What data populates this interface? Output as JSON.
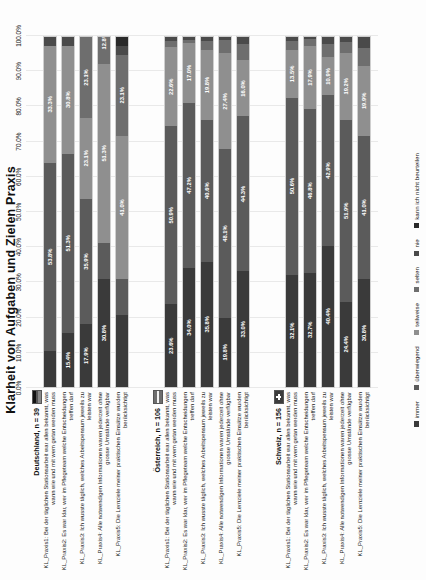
{
  "chart_data": {
    "type": "bar",
    "orientation": "horizontal",
    "stacked": true,
    "stack_mode": "percent",
    "title": "Klarheit von Aufgaben und Zielen Praxis",
    "xlabel": "",
    "ylabel": "",
    "xlim": [
      0,
      100
    ],
    "grid": true,
    "legend_position": "bottom",
    "tick_labels": [
      "0.0%",
      "10.0%",
      "20.0%",
      "30.0%",
      "40.0%",
      "50.0%",
      "60.0%",
      "70.0%",
      "80.0%",
      "90.0%",
      "100.0%"
    ],
    "tick_values": [
      0,
      10,
      20,
      30,
      40,
      50,
      60,
      70,
      80,
      90,
      100
    ],
    "legend": [
      {
        "name": "immer",
        "color": "#3a3a3a"
      },
      {
        "name": "überwiegend",
        "color": "#5b5b5b"
      },
      {
        "name": "teilweise",
        "color": "#8f8f8f"
      },
      {
        "name": "selten",
        "color": "#6e6e6e"
      },
      {
        "name": "nie",
        "color": "#4a4a4a"
      },
      {
        "name": "kann ich nicht beurteilen",
        "color": "#2a2a2a"
      }
    ],
    "groups": [
      {
        "key": "deutschland",
        "label": "Deutschland, n = 39",
        "flag": "flag-de",
        "flag_name": "germany-flag-icon",
        "categories": [
          "KL_Praxis1: Bei der täglichen Stationsarbeit war allen bekannt, was wann wie und mit wem getan werden muss",
          "KL_Praxis2: Es war klar, wer im Pflegeteam welche Entscheidungen treffen darf",
          "KL_Praxis3: Ich wusste täglich, welches Arbeitspensum jeweils zu leisten war",
          "KL_Praxis4: Alle notwendigen Informationen waren jederzeit ohne grosse Umstände verfügbar",
          "KL_Praxis5: Die Lernziele meiner praktischen Einsätze wurden berücksichtigt"
        ],
        "series": [
          {
            "name": "immer",
            "values": [
              10.3,
              15.4,
              17.9,
              30.8,
              20.5
            ]
          },
          {
            "name": "überwiegend",
            "values": [
              53.8,
              51.3,
              35.9,
              10.3,
              10.3
            ]
          },
          {
            "name": "teilweise",
            "values": [
              33.3,
              30.8,
              23.1,
              51.3,
              41.0
            ]
          },
          {
            "name": "selten",
            "values": [
              0.0,
              0.0,
              23.1,
              12.8,
              23.1
            ]
          },
          {
            "name": "nie",
            "values": [
              2.6,
              2.5,
              0.0,
              2.6,
              2.6
            ]
          },
          {
            "name": "kann ich nicht beurteilen",
            "values": [
              0.0,
              0.0,
              0.0,
              2.2,
              2.5
            ]
          }
        ],
        "labeled_values": [
          [
            "15.4%",
            "53.8%",
            "33.3%"
          ],
          [
            "15.4%",
            "51.3%",
            "30.8%"
          ],
          [
            "17.9%",
            "35.9%",
            "23.1%",
            "23.1%"
          ],
          [
            "30.8%",
            "51.3%",
            "12.8%"
          ],
          [
            "30.8%",
            "41.0%",
            "23.1%"
          ]
        ]
      },
      {
        "key": "oesterreich",
        "label": "Österreich, n = 106",
        "flag": "flag-at",
        "flag_name": "austria-flag-icon",
        "categories": [
          "KL_Praxis1: Bei der täglichen Stationsarbeit war allen bekannt, was wann wie und mit wem getan werden muss",
          "KL_Praxis2: Es war klar, wer im Pflegeteam welche Entscheidungen treffen darf",
          "KL_Praxis3: Ich wusste täglich, welches Arbeitspensum jeweils zu leisten war",
          "KL_Praxis4: Alle notwendigen Informationen waren jederzeit ohne grosse Umstände verfügbar",
          "KL_Praxis5: Die Lernziele meiner praktischen Einsätze wurden berücksichtigt"
        ],
        "series": [
          {
            "name": "immer",
            "values": [
              23.6,
              34.0,
              35.8,
              19.8,
              33.0
            ]
          },
          {
            "name": "überwiegend",
            "values": [
              50.9,
              47.2,
              40.6,
              48.1,
              44.3
            ]
          },
          {
            "name": "teilweise",
            "values": [
              22.6,
              17.0,
              19.8,
              27.4,
              16.0
            ]
          },
          {
            "name": "selten",
            "values": [
              1.9,
              1.0,
              2.8,
              3.8,
              4.7
            ]
          },
          {
            "name": "nie",
            "values": [
              1.0,
              0.8,
              1.0,
              0.9,
              2.0
            ]
          },
          {
            "name": "kann ich nicht beurteilen",
            "values": [
              0.0,
              0.0,
              0.0,
              0.0,
              0.0
            ]
          }
        ],
        "labeled_values": [
          [
            "23.6%",
            "50.9%",
            "22.6%"
          ],
          [
            "34.0%",
            "47.2%",
            "17.0%"
          ],
          [
            "35.8%",
            "40.6%",
            "19.8%"
          ],
          [
            "19.8%",
            "48.1%",
            "27.4%"
          ],
          [
            "33.0%",
            "44.3%",
            "16.0%"
          ]
        ]
      },
      {
        "key": "schweiz",
        "label": "Schweiz, n = 156",
        "flag": "flag-ch",
        "flag_name": "switzerland-flag-icon",
        "categories": [
          "KL_Praxis1: Bei der täglichen Stationsarbeit war allen bekannt, was wann wie und mit wem getan werden muss",
          "KL_Praxis2: Es war klar, wer im Pflegeteam welche Entscheidungen treffen darf",
          "KL_Praxis3: Ich wusste täglich, welches Arbeitspensum jeweils zu leisten war",
          "KL_Praxis4: Alle notwendigen Informationen waren jederzeit ohne grosse Umstände verfügbar",
          "KL_Praxis5: Die Lernziele meiner praktischen Einsätze wurden berücksichtigt"
        ],
        "series": [
          {
            "name": "immer",
            "values": [
              32.1,
              32.7,
              40.4,
              24.4,
              30.8
            ]
          },
          {
            "name": "überwiegend",
            "values": [
              50.6,
              46.8,
              42.9,
              51.9,
              41.0
            ]
          },
          {
            "name": "teilweise",
            "values": [
              13.5,
              17.9,
              10.9,
              19.2,
              19.9
            ]
          },
          {
            "name": "selten",
            "values": [
              2.6,
              1.9,
              3.8,
              3.2,
              5.1
            ]
          },
          {
            "name": "nie",
            "values": [
              1.2,
              0.7,
              2.0,
              1.3,
              3.2
            ]
          },
          {
            "name": "kann ich nicht beurteilen",
            "values": [
              0.0,
              0.0,
              0.0,
              0.0,
              0.0
            ]
          }
        ],
        "labeled_values": [
          [
            "32.1%",
            "50.6%",
            "13.5%"
          ],
          [
            "32.7%",
            "46.8%",
            "17.9%"
          ],
          [
            "40.4%",
            "42.9%",
            "10.9%"
          ],
          [
            "24.4%",
            "51.9%",
            "19.2%"
          ],
          [
            "30.8%",
            "41.0%",
            "19.9%"
          ]
        ]
      }
    ]
  }
}
